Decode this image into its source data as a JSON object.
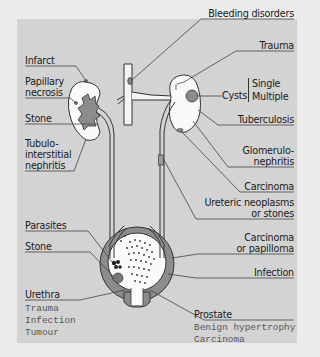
{
  "diagram": {
    "kidney_left_labels": [
      "Infarct",
      "Papillary",
      "necrosis",
      "Stone",
      "Tubulo-",
      "interstitial",
      "nephritis"
    ],
    "kidney_right_labels": {
      "bleeding": "Bleeding disorders",
      "trauma": "Trauma",
      "cysts": "Cysts",
      "cysts_single": "Single",
      "cysts_multiple": "Multiple",
      "tuberculosis": "Tuberculosis",
      "glomerulo_1": "Glomerulo-",
      "glomerulo_2": "nephritis",
      "carcinoma": "Carcinoma"
    },
    "ureter_labels": {
      "line1": "Ureteric neoplasms",
      "line2": "or stones"
    },
    "bladder_labels": {
      "parasites": "Parasites",
      "stone": "Stone",
      "carcinoma_1": "Carcinoma",
      "carcinoma_2": "or papilloma",
      "infection": "Infection"
    },
    "urethra": {
      "title": "Urethra",
      "items": [
        "Trauma",
        "Infection",
        "Tumour"
      ]
    },
    "prostate": {
      "title": "Prostate",
      "items": [
        "Benign hypertrophy",
        "Carcinoma"
      ]
    }
  }
}
